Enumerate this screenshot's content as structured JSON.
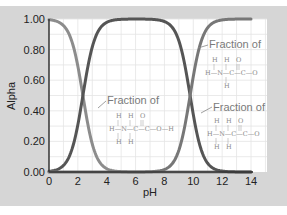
{
  "chart_data": {
    "type": "line",
    "title": "",
    "xlabel": "pH",
    "ylabel": "Alpha",
    "xlim": [
      0,
      14
    ],
    "ylim": [
      0,
      1
    ],
    "x_ticks": [
      "0",
      "2",
      "4",
      "6",
      "8",
      "10",
      "12",
      "14"
    ],
    "y_ticks": [
      "0.00",
      "0.20",
      "0.40",
      "0.60",
      "0.80",
      "1.00"
    ],
    "grid": true,
    "legend": "annotations",
    "x": [
      0,
      0.5,
      1,
      1.5,
      2,
      2.35,
      2.5,
      3,
      3.5,
      4,
      4.5,
      5,
      6,
      7,
      8,
      8.5,
      9,
      9.5,
      9.78,
      10,
      10.5,
      11,
      11.5,
      12,
      13,
      14
    ],
    "series": [
      {
        "name": "Fraction of H3N+-CH2-COOH (cation)",
        "color": "#8c8c8c",
        "values": [
          0.996,
          0.986,
          0.957,
          0.876,
          0.691,
          0.5,
          0.415,
          0.183,
          0.066,
          0.022,
          0.007,
          0.002,
          0.0,
          0.0,
          0.0,
          0.0,
          0.0,
          0.0,
          0.0,
          0.0,
          0.0,
          0.0,
          0.0,
          0.0,
          0.0,
          0.0
        ]
      },
      {
        "name": "Fraction of H3N+-CH2-COO- (zwitterion)",
        "color": "#555555",
        "values": [
          0.004,
          0.014,
          0.043,
          0.124,
          0.309,
          0.5,
          0.585,
          0.817,
          0.934,
          0.978,
          0.993,
          0.998,
          1.0,
          0.998,
          0.984,
          0.951,
          0.858,
          0.656,
          0.5,
          0.376,
          0.16,
          0.057,
          0.019,
          0.006,
          0.001,
          0.0
        ]
      },
      {
        "name": "Fraction of H2N-CH2-COO- (anion)",
        "color": "#777777",
        "values": [
          0.0,
          0.0,
          0.0,
          0.0,
          0.0,
          0.0,
          0.0,
          0.0,
          0.0,
          0.0,
          0.0,
          0.0,
          0.0,
          0.002,
          0.016,
          0.049,
          0.142,
          0.344,
          0.5,
          0.624,
          0.84,
          0.943,
          0.981,
          0.994,
          0.999,
          1.0
        ]
      }
    ],
    "annotations": [
      {
        "text": "Fraction of",
        "molecule": "H-N(H)-C(H)(H)-C(=O)-O",
        "target": "anion",
        "position": "upper-right"
      },
      {
        "text": "Fraction of",
        "molecule": "H-N(H)(H)-C(H)(H)-C(=O)-O-H",
        "target": "cation",
        "position": "middle-left"
      },
      {
        "text": "Fraction of",
        "molecule": "H-N(H)(H)-C(H)(H)-C(=O)-O",
        "target": "zwitterion",
        "position": "lower-right"
      }
    ]
  },
  "labels": {
    "xlabel": "pH",
    "ylabel": "Alpha",
    "ann1": "Fraction of",
    "ann2": "Fraction of",
    "ann3": "Fraction of"
  },
  "style": {
    "background_outer": "#d6d6d6",
    "plot_background": "#ffffff",
    "grid_color": "#e2e2e2",
    "axis_color": "#333333"
  }
}
